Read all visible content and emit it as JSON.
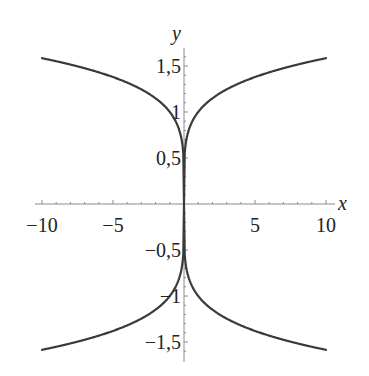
{
  "chart_data": {
    "type": "line",
    "title": "",
    "xlabel": "x",
    "ylabel": "y",
    "xlim": [
      -10,
      10
    ],
    "ylim": [
      -1.6,
      1.6
    ],
    "grid": false,
    "legend": null,
    "x_ticks": [
      {
        "value": -10,
        "label": "−10"
      },
      {
        "value": -5,
        "label": "−5"
      },
      {
        "value": 5,
        "label": "5"
      },
      {
        "value": 10,
        "label": "10"
      }
    ],
    "y_ticks": [
      {
        "value": 1.5,
        "label": "1,5"
      },
      {
        "value": 1,
        "label": "1"
      },
      {
        "value": 0.5,
        "label": "0,5"
      },
      {
        "value": -0.5,
        "label": "−0,5"
      },
      {
        "value": -1,
        "label": "−1"
      },
      {
        "value": -1.5,
        "label": "−1,5"
      }
    ],
    "x_minor_step": 1,
    "y_minor_step": 0.1,
    "series": [
      {
        "name": "upper branch y = |x|^(1/5)",
        "x": [
          -10,
          -8,
          -6,
          -4,
          -2,
          -1,
          -0.5,
          -0.1,
          0,
          0.1,
          0.5,
          1,
          2,
          4,
          6,
          8,
          10
        ],
        "y": [
          1.585,
          1.516,
          1.431,
          1.32,
          1.149,
          1.0,
          0.871,
          0.631,
          0,
          0.631,
          0.871,
          1.0,
          1.149,
          1.32,
          1.431,
          1.516,
          1.585
        ]
      },
      {
        "name": "lower branch y = -|x|^(1/5)",
        "x": [
          -10,
          -8,
          -6,
          -4,
          -2,
          -1,
          -0.5,
          -0.1,
          0,
          0.1,
          0.5,
          1,
          2,
          4,
          6,
          8,
          10
        ],
        "y": [
          -1.585,
          -1.516,
          -1.431,
          -1.32,
          -1.149,
          -1.0,
          -0.871,
          -0.631,
          0,
          -0.631,
          -0.871,
          -1.0,
          -1.149,
          -1.32,
          -1.431,
          -1.516,
          -1.585
        ]
      }
    ],
    "colors": {
      "curve": "#3a3a3a",
      "axis": "#8a8a8a",
      "text": "#222222"
    }
  },
  "layout": {
    "origin_px": [
      184,
      204
    ],
    "x_px_per_unit": 14.2,
    "y_px_per_unit": 92,
    "x_axis_px": [
      35,
      335
    ],
    "y_axis_px": [
      48,
      362
    ]
  }
}
